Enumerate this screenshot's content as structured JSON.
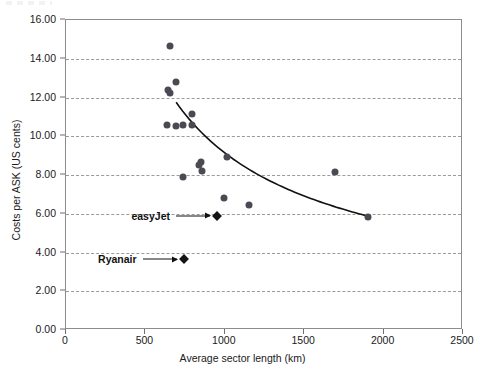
{
  "chart_data": {
    "type": "scatter",
    "title": "",
    "xlabel": "Average sector length (km)",
    "ylabel": "Costs per ASK (US cents)",
    "xlim": [
      0,
      2500
    ],
    "ylim": [
      0,
      16
    ],
    "xticks": [
      "0",
      "500",
      "1000",
      "1500",
      "2000",
      "2500"
    ],
    "xtick_values": [
      0,
      500,
      1000,
      1500,
      2000,
      2500
    ],
    "yticks": [
      "0.00",
      "2.00",
      "4.00",
      "6.00",
      "8.00",
      "10.00",
      "12.00",
      "14.00",
      "16.00"
    ],
    "ytick_values": [
      0,
      2,
      4,
      6,
      8,
      10,
      12,
      14,
      16
    ],
    "grid": "horizontal-dashed",
    "legend": "none",
    "marker_color": "#4a4a52",
    "highlight_marker_color": "#141414",
    "series": [
      {
        "name": "Airlines",
        "marker": "circle",
        "points": [
          [
            660,
            14.6
          ],
          [
            700,
            12.75
          ],
          [
            650,
            12.35
          ],
          [
            660,
            12.2
          ],
          [
            800,
            11.1
          ],
          [
            640,
            10.55
          ],
          [
            700,
            10.5
          ],
          [
            745,
            10.55
          ],
          [
            800,
            10.55
          ],
          [
            1020,
            8.9
          ],
          [
            855,
            8.6
          ],
          [
            845,
            8.45
          ],
          [
            860,
            8.15
          ],
          [
            740,
            7.85
          ],
          [
            1000,
            6.75
          ],
          [
            1160,
            6.4
          ],
          [
            1700,
            8.1
          ],
          [
            1910,
            5.8
          ]
        ]
      },
      {
        "name": "Low-cost carriers",
        "marker": "diamond",
        "points": [
          [
            960,
            5.85
          ],
          [
            750,
            3.6
          ]
        ]
      }
    ],
    "trend_curve": {
      "type": "power-decay",
      "from": [
        700,
        11.7
      ],
      "to": [
        1910,
        5.82
      ],
      "description": "fitted downward-sloping cost curve"
    },
    "annotations": [
      {
        "label": "easyJet",
        "target_point": [
          960,
          5.85
        ],
        "arrow": "right"
      },
      {
        "label": "Ryanair",
        "target_point": [
          750,
          3.6
        ],
        "arrow": "right"
      }
    ]
  }
}
